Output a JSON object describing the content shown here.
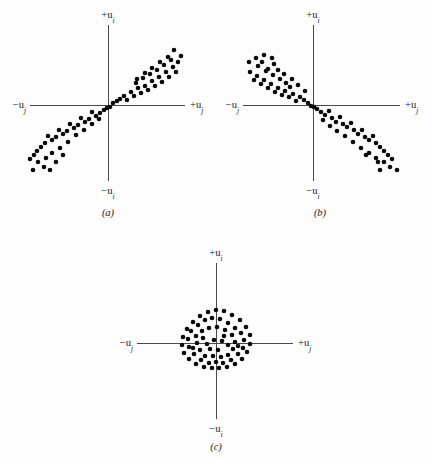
{
  "figure": {
    "background_color": "#fdfdfd",
    "axis_color": "#4a4a4a",
    "dot_color": "#0a0a0a",
    "dot_radius": 2.3
  },
  "labels": {
    "pos_vertical": "+u",
    "pos_vertical_sub": "i",
    "neg_vertical": "−u",
    "neg_vertical_sub": "i",
    "pos_horizontal": "+u",
    "pos_horizontal_sub": "j",
    "neg_horizontal": "−u",
    "neg_horizontal_sub": "j"
  },
  "chart_data": {
    "type": "scatter",
    "title": "",
    "xlabel": "u_j",
    "ylabel": "u_i",
    "grid": false,
    "legend": null,
    "xlim": [
      -1,
      1
    ],
    "ylim": [
      -1,
      1
    ],
    "panels": [
      {
        "id": "a",
        "caption": "(a)",
        "relationship": "positive correlation",
        "origin": {
          "x": 108,
          "y": 105
        },
        "axis_x": {
          "x1": 30,
          "x2": 185,
          "y": 105
        },
        "axis_y": {
          "y1": 25,
          "y2": 181,
          "x": 108
        },
        "labels": {
          "top": {
            "x": 108,
            "y": 18,
            "anchor": "middle"
          },
          "bottom": {
            "x": 108,
            "y": 194,
            "anchor": "middle"
          },
          "right": {
            "x": 190,
            "y": 108,
            "anchor": "start"
          },
          "left": {
            "x": 26,
            "y": 108,
            "anchor": "end"
          },
          "caption": {
            "x": 108,
            "y": 216
          }
        },
        "points": [
          [
            113,
            103
          ],
          [
            117,
            101
          ],
          [
            110,
            107
          ],
          [
            120,
            99
          ],
          [
            124,
            96
          ],
          [
            127,
            100
          ],
          [
            131,
            92
          ],
          [
            134,
            96
          ],
          [
            138,
            88
          ],
          [
            141,
            93
          ],
          [
            136,
            83
          ],
          [
            145,
            86
          ],
          [
            148,
            90
          ],
          [
            143,
            78
          ],
          [
            152,
            81
          ],
          [
            155,
            86
          ],
          [
            150,
            74
          ],
          [
            159,
            77
          ],
          [
            162,
            82
          ],
          [
            157,
            70
          ],
          [
            166,
            72
          ],
          [
            169,
            77
          ],
          [
            164,
            65
          ],
          [
            173,
            67
          ],
          [
            176,
            72
          ],
          [
            171,
            60
          ],
          [
            178,
            62
          ],
          [
            181,
            56
          ],
          [
            168,
            57
          ],
          [
            174,
            50
          ],
          [
            160,
            62
          ],
          [
            152,
            68
          ],
          [
            145,
            73
          ],
          [
            137,
            79
          ],
          [
            104,
            110
          ],
          [
            100,
            113
          ],
          [
            107,
            108
          ],
          [
            96,
            116
          ],
          [
            92,
            112
          ],
          [
            89,
            119
          ],
          [
            85,
            122
          ],
          [
            81,
            118
          ],
          [
            78,
            125
          ],
          [
            74,
            128
          ],
          [
            70,
            124
          ],
          [
            67,
            131
          ],
          [
            63,
            134
          ],
          [
            59,
            130
          ],
          [
            56,
            137
          ],
          [
            52,
            140
          ],
          [
            48,
            136
          ],
          [
            45,
            143
          ],
          [
            41,
            147
          ],
          [
            37,
            151
          ],
          [
            34,
            155
          ],
          [
            30,
            159
          ],
          [
            38,
            162
          ],
          [
            46,
            158
          ],
          [
            52,
            153
          ],
          [
            60,
            148
          ],
          [
            68,
            142
          ],
          [
            44,
            167
          ],
          [
            56,
            162
          ],
          [
            33,
            170
          ],
          [
            50,
            170
          ],
          [
            63,
            155
          ],
          [
            76,
            135
          ],
          [
            84,
            130
          ],
          [
            92,
            124
          ],
          [
            99,
            119
          ]
        ]
      },
      {
        "id": "b",
        "caption": "(b)",
        "relationship": "negative correlation",
        "origin": {
          "x": 313,
          "y": 105
        },
        "axis_x": {
          "x1": 243,
          "x2": 400,
          "y": 105
        },
        "axis_y": {
          "y1": 25,
          "y2": 181,
          "x": 313
        },
        "labels": {
          "top": {
            "x": 313,
            "y": 18,
            "anchor": "middle"
          },
          "bottom": {
            "x": 313,
            "y": 194,
            "anchor": "middle"
          },
          "right": {
            "x": 405,
            "y": 108,
            "anchor": "start"
          },
          "left": {
            "x": 239,
            "y": 108,
            "anchor": "end"
          },
          "caption": {
            "x": 320,
            "y": 216
          }
        },
        "points": [
          [
            308,
            103
          ],
          [
            304,
            100
          ],
          [
            311,
            106
          ],
          [
            300,
            97
          ],
          [
            296,
            101
          ],
          [
            293,
            94
          ],
          [
            289,
            97
          ],
          [
            285,
            91
          ],
          [
            282,
            95
          ],
          [
            290,
            87
          ],
          [
            278,
            88
          ],
          [
            275,
            92
          ],
          [
            286,
            83
          ],
          [
            271,
            84
          ],
          [
            268,
            88
          ],
          [
            280,
            79
          ],
          [
            264,
            80
          ],
          [
            261,
            84
          ],
          [
            273,
            75
          ],
          [
            257,
            76
          ],
          [
            254,
            80
          ],
          [
            266,
            71
          ],
          [
            250,
            72
          ],
          [
            258,
            66
          ],
          [
            262,
            62
          ],
          [
            268,
            69
          ],
          [
            274,
            64
          ],
          [
            256,
            58
          ],
          [
            264,
            55
          ],
          [
            272,
            58
          ],
          [
            249,
            62
          ],
          [
            278,
            70
          ],
          [
            284,
            74
          ],
          [
            292,
            79
          ],
          [
            298,
            85
          ],
          [
            305,
            91
          ],
          [
            317,
            109
          ],
          [
            321,
            112
          ],
          [
            314,
            107
          ],
          [
            325,
            115
          ],
          [
            329,
            111
          ],
          [
            332,
            118
          ],
          [
            336,
            122
          ],
          [
            340,
            117
          ],
          [
            343,
            124
          ],
          [
            347,
            127
          ],
          [
            351,
            123
          ],
          [
            354,
            130
          ],
          [
            358,
            134
          ],
          [
            362,
            130
          ],
          [
            365,
            137
          ],
          [
            369,
            140
          ],
          [
            373,
            136
          ],
          [
            376,
            143
          ],
          [
            380,
            147
          ],
          [
            384,
            151
          ],
          [
            388,
            155
          ],
          [
            392,
            159
          ],
          [
            384,
            162
          ],
          [
            376,
            158
          ],
          [
            369,
            153
          ],
          [
            361,
            148
          ],
          [
            353,
            142
          ],
          [
            390,
            167
          ],
          [
            378,
            162
          ],
          [
            397,
            170
          ],
          [
            380,
            170
          ],
          [
            366,
            155
          ],
          [
            345,
            136
          ],
          [
            337,
            131
          ],
          [
            330,
            126
          ],
          [
            323,
            120
          ]
        ]
      },
      {
        "id": "c",
        "caption": "(c)",
        "relationship": "no correlation",
        "origin": {
          "x": 216,
          "y": 343
        },
        "axis_x": {
          "x1": 137,
          "x2": 293,
          "y": 343
        },
        "axis_y": {
          "y1": 263,
          "y2": 419,
          "x": 216
        },
        "labels": {
          "top": {
            "x": 216,
            "y": 256,
            "anchor": "middle"
          },
          "bottom": {
            "x": 216,
            "y": 432,
            "anchor": "middle"
          },
          "right": {
            "x": 298,
            "y": 346,
            "anchor": "start"
          },
          "left": {
            "x": 133,
            "y": 346,
            "anchor": "end"
          },
          "caption": {
            "x": 216,
            "y": 450
          }
        },
        "points": [
          [
            216,
            310
          ],
          [
            208,
            312
          ],
          [
            224,
            311
          ],
          [
            200,
            316
          ],
          [
            232,
            315
          ],
          [
            193,
            322
          ],
          [
            240,
            320
          ],
          [
            187,
            329
          ],
          [
            246,
            327
          ],
          [
            183,
            337
          ],
          [
            250,
            335
          ],
          [
            182,
            345
          ],
          [
            250,
            344
          ],
          [
            184,
            353
          ],
          [
            247,
            352
          ],
          [
            189,
            359
          ],
          [
            242,
            359
          ],
          [
            196,
            364
          ],
          [
            235,
            364
          ],
          [
            204,
            367
          ],
          [
            227,
            367
          ],
          [
            212,
            368
          ],
          [
            219,
            368
          ],
          [
            205,
            320
          ],
          [
            212,
            318
          ],
          [
            220,
            319
          ],
          [
            228,
            323
          ],
          [
            198,
            325
          ],
          [
            235,
            328
          ],
          [
            191,
            331
          ],
          [
            241,
            333
          ],
          [
            188,
            339
          ],
          [
            244,
            340
          ],
          [
            189,
            347
          ],
          [
            243,
            348
          ],
          [
            194,
            354
          ],
          [
            238,
            354
          ],
          [
            201,
            360
          ],
          [
            231,
            360
          ],
          [
            209,
            363
          ],
          [
            223,
            363
          ],
          [
            216,
            362
          ],
          [
            202,
            331
          ],
          [
            209,
            328
          ],
          [
            217,
            327
          ],
          [
            225,
            330
          ],
          [
            232,
            335
          ],
          [
            196,
            336
          ],
          [
            235,
            342
          ],
          [
            197,
            343
          ],
          [
            233,
            349
          ],
          [
            200,
            350
          ],
          [
            228,
            355
          ],
          [
            205,
            356
          ],
          [
            221,
            357
          ],
          [
            213,
            356
          ],
          [
            207,
            344
          ],
          [
            214,
            340
          ],
          [
            222,
            341
          ],
          [
            228,
            345
          ],
          [
            210,
            349
          ],
          [
            218,
            350
          ],
          [
            224,
            336
          ],
          [
            203,
            338
          ],
          [
            238,
            346
          ],
          [
            193,
            348
          ]
        ]
      }
    ]
  }
}
